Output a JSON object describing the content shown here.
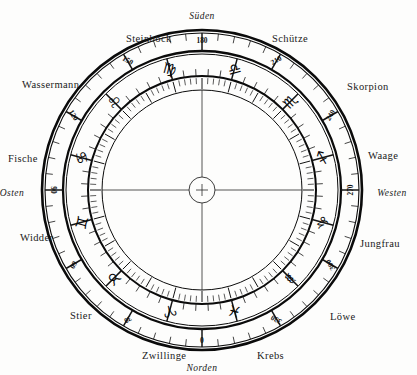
{
  "figure": {
    "background_color": "#fdfdfc",
    "ink_color": "#0b0b0b"
  },
  "center": {
    "cx": 202,
    "cy": 190,
    "hub_radius": 13,
    "hub_symbol": "+"
  },
  "rings": {
    "outer_border_radius": 160,
    "degree_ring_outer_radius": 157,
    "degree_ring_inner_radius": 139,
    "zodiac_ring_outer_radius": 136,
    "zodiac_ring_inner_radius": 114,
    "tick_ring_outer_radius": 112,
    "tick_ring_inner_radius": 100
  },
  "cardinals": [
    {
      "label": "Süden",
      "position": "top",
      "x": 202,
      "y": 16
    },
    {
      "label": "Westen",
      "position": "right",
      "x": 392,
      "y": 193
    },
    {
      "label": "Norden",
      "position": "bottom",
      "x": 202,
      "y": 368
    },
    {
      "label": "Osten",
      "position": "left",
      "x": 12,
      "y": 193
    }
  ],
  "chart_data": {
    "type": "pie",
    "xlabel": "",
    "ylabel": "",
    "degree_step": 30,
    "degree_labels": [
      {
        "value": "0",
        "angle_deg": 0
      },
      {
        "value": "30",
        "angle_deg": 30
      },
      {
        "value": "60",
        "angle_deg": 60
      },
      {
        "value": "90",
        "angle_deg": 90
      },
      {
        "value": "120",
        "angle_deg": 120
      },
      {
        "value": "150",
        "angle_deg": 150
      },
      {
        "value": "180",
        "angle_deg": 180
      },
      {
        "value": "210",
        "angle_deg": 210
      },
      {
        "value": "240",
        "angle_deg": 240
      },
      {
        "value": "270",
        "angle_deg": 270
      },
      {
        "value": "300",
        "angle_deg": 300
      },
      {
        "value": "330",
        "angle_deg": 330
      }
    ],
    "categories": [
      "Widder",
      "Stier",
      "Zwillinge",
      "Krebs",
      "Löwe",
      "Jungfrau",
      "Waage",
      "Skorpion",
      "Schütze",
      "Steinbock",
      "Wassermann",
      "Fische"
    ],
    "values": [
      30,
      30,
      30,
      30,
      30,
      30,
      30,
      30,
      30,
      30,
      30,
      30
    ],
    "signs": [
      {
        "name": "Widder",
        "glyph": "♈",
        "glyph_name": "aries-glyph",
        "sector_start_deg": 0,
        "label_x": 20,
        "label_y": 232
      },
      {
        "name": "Stier",
        "glyph": "♉",
        "glyph_name": "taurus-glyph",
        "sector_start_deg": 30,
        "label_x": 70,
        "label_y": 310
      },
      {
        "name": "Zwillinge",
        "glyph": "♊",
        "glyph_name": "gemini-glyph",
        "sector_start_deg": 60,
        "label_x": 142,
        "label_y": 350
      },
      {
        "name": "Krebs",
        "glyph": "♋",
        "glyph_name": "cancer-glyph",
        "sector_start_deg": 90,
        "label_x": 257,
        "label_y": 350
      },
      {
        "name": "Löwe",
        "glyph": "♌",
        "glyph_name": "leo-glyph",
        "sector_start_deg": 120,
        "label_x": 330,
        "label_y": 311
      },
      {
        "name": "Jungfrau",
        "glyph": "♍",
        "glyph_name": "virgo-glyph",
        "sector_start_deg": 150,
        "label_x": 360,
        "label_y": 238
      },
      {
        "name": "Waage",
        "glyph": "♎",
        "glyph_name": "libra-glyph",
        "sector_start_deg": 180,
        "label_x": 368,
        "label_y": 150
      },
      {
        "name": "Skorpion",
        "glyph": "♏",
        "glyph_name": "scorpio-glyph",
        "sector_start_deg": 210,
        "label_x": 347,
        "label_y": 81
      },
      {
        "name": "Schütze",
        "glyph": "♐",
        "glyph_name": "sagittarius-glyph",
        "sector_start_deg": 240,
        "label_x": 272,
        "label_y": 33
      },
      {
        "name": "Steinbock",
        "glyph": "♑",
        "glyph_name": "capricorn-glyph",
        "sector_start_deg": 270,
        "label_x": 126,
        "label_y": 33
      },
      {
        "name": "Wassermann",
        "glyph": "♒",
        "glyph_name": "aquarius-glyph",
        "sector_start_deg": 300,
        "label_x": 22,
        "label_y": 79
      },
      {
        "name": "Fische",
        "glyph": "♓",
        "glyph_name": "pisces-glyph",
        "sector_start_deg": 330,
        "label_x": 8,
        "label_y": 153
      }
    ]
  }
}
